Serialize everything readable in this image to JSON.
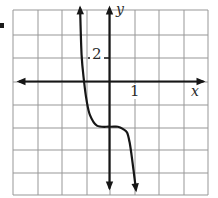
{
  "figure": {
    "y_axis_label": "y",
    "x_axis_label": "x",
    "y_tick_label": "2",
    "x_tick_label": "1"
  },
  "colors": {
    "background": "#ffffff",
    "grid_line": "#979797",
    "axis": "#161616",
    "curve": "#161616",
    "label_text": "#2a2a2a"
  },
  "chart_data": {
    "type": "line",
    "title": "",
    "xlabel": "x",
    "ylabel": "y",
    "x_axis": {
      "tick_labels": [
        "1"
      ],
      "range": [
        -4,
        4
      ],
      "units_per_grid_square": 1
    },
    "y_axis": {
      "tick_labels": [
        "2"
      ],
      "range": [
        -10,
        6
      ],
      "units_per_grid_square": 2
    },
    "grid": {
      "columns": 8,
      "rows": 8,
      "visible": true
    },
    "series": [
      {
        "name": "steep-decreasing-s-curve",
        "style": "solid-black-with-arrowheads-both-ends",
        "x_intercept": -1,
        "y_intercept": -3.9,
        "points": [
          [
            -1.19,
            6.3
          ],
          [
            -1.13,
            2.3
          ],
          [
            -1.03,
            0.0
          ],
          [
            -0.93,
            -1.6
          ],
          [
            -0.79,
            -2.9
          ],
          [
            -0.51,
            -3.8
          ],
          [
            0.0,
            -3.9
          ],
          [
            0.34,
            -3.9
          ],
          [
            0.55,
            -4.1
          ],
          [
            0.71,
            -4.4
          ],
          [
            0.81,
            -5.2
          ],
          [
            0.89,
            -6.3
          ],
          [
            0.97,
            -7.6
          ],
          [
            1.07,
            -9.3
          ]
        ]
      }
    ]
  }
}
